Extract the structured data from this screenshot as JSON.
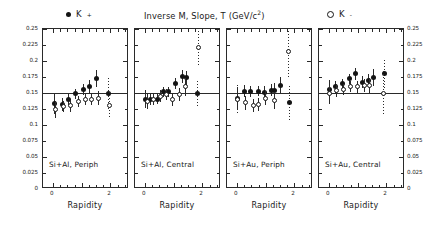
{
  "figure": {
    "title": "Inverse M, Slope, T (GeV/c",
    "title_sup": "2",
    "title_close": ")",
    "legend": [
      {
        "marker": "filled-circle",
        "label": "K",
        "sup": "+",
        "name": "legend-k-plus"
      },
      {
        "marker": "open-circle",
        "label": "K",
        "sup": "-",
        "name": "legend-k-minus"
      }
    ],
    "axis_title_x": "Rapidity"
  },
  "chart_data": {
    "type": "scatter",
    "xlabel": "Rapidity",
    "ylabel": "T (GeV/c^2)",
    "xlim": [
      -0.35,
      2.65
    ],
    "ylim": [
      0,
      0.25
    ],
    "xticks": [
      0,
      2
    ],
    "xticklabels": [
      "0",
      "2"
    ],
    "yticks": [
      0,
      0.025,
      0.05,
      0.075,
      0.1,
      0.125,
      0.15,
      0.175,
      0.2,
      0.225,
      0.25
    ],
    "yticklabels": [
      "0",
      "0.025",
      "0.05",
      "0.075",
      "0.1",
      "0.125",
      "0.15",
      "0.175",
      "0.2",
      "0.225",
      "0.25"
    ],
    "grid": false,
    "reference_line_y": 0.15,
    "legend_position": "top",
    "panels": [
      {
        "label": "Si+Al, Periph",
        "series": [
          {
            "name": "K+",
            "marker": "filled-circle",
            "points": [
              {
                "x": 0.05,
                "y": 0.1335,
                "yerr": 0.016
              },
              {
                "x": 0.32,
                "y": 0.132,
                "yerr": 0.01
              },
              {
                "x": 0.55,
                "y": 0.14,
                "yerr": 0.009
              },
              {
                "x": 0.8,
                "y": 0.149,
                "yerr": 0.008
              },
              {
                "x": 1.08,
                "y": 0.1555,
                "yerr": 0.009
              },
              {
                "x": 1.28,
                "y": 0.16,
                "yerr": 0.01
              },
              {
                "x": 1.52,
                "y": 0.1725,
                "yerr": 0.013
              },
              {
                "x": 1.95,
                "y": 0.149,
                "yerr": 0.024
              }
            ]
          },
          {
            "name": "K-",
            "marker": "open-circle",
            "points": [
              {
                "x": 0.1,
                "y": 0.1245,
                "yerr": 0.013
              },
              {
                "x": 0.36,
                "y": 0.129,
                "yerr": 0.009
              },
              {
                "x": 0.6,
                "y": 0.13,
                "yerr": 0.009
              },
              {
                "x": 0.88,
                "y": 0.137,
                "yerr": 0.009
              },
              {
                "x": 1.12,
                "y": 0.1395,
                "yerr": 0.009
              },
              {
                "x": 1.34,
                "y": 0.14,
                "yerr": 0.009
              },
              {
                "x": 1.58,
                "y": 0.1415,
                "yerr": 0.011
              },
              {
                "x": 1.98,
                "y": 0.131,
                "yerr": 0.021
              }
            ]
          }
        ]
      },
      {
        "label": "Si+Al, Central",
        "series": [
          {
            "name": "K+",
            "marker": "filled-circle",
            "points": [
              {
                "x": 0.02,
                "y": 0.14,
                "yerr": 0.014
              },
              {
                "x": 0.2,
                "y": 0.1395,
                "yerr": 0.009
              },
              {
                "x": 0.44,
                "y": 0.1405,
                "yerr": 0.008
              },
              {
                "x": 0.66,
                "y": 0.152,
                "yerr": 0.008
              },
              {
                "x": 0.82,
                "y": 0.152,
                "yerr": 0.008
              },
              {
                "x": 1.08,
                "y": 0.1645,
                "yerr": 0.009
              },
              {
                "x": 1.32,
                "y": 0.176,
                "yerr": 0.01
              },
              {
                "x": 1.44,
                "y": 0.1735,
                "yerr": 0.011
              },
              {
                "x": 1.82,
                "y": 0.1495,
                "yerr": 0.02
              }
            ]
          },
          {
            "name": "K-",
            "marker": "open-circle",
            "points": [
              {
                "x": 0.08,
                "y": 0.137,
                "yerr": 0.012
              },
              {
                "x": 0.3,
                "y": 0.14,
                "yerr": 0.009
              },
              {
                "x": 0.54,
                "y": 0.145,
                "yerr": 0.009
              },
              {
                "x": 0.74,
                "y": 0.148,
                "yerr": 0.009
              },
              {
                "x": 0.96,
                "y": 0.1395,
                "yerr": 0.01
              },
              {
                "x": 1.2,
                "y": 0.148,
                "yerr": 0.01
              },
              {
                "x": 1.4,
                "y": 0.1595,
                "yerr": 0.014
              },
              {
                "x": 1.88,
                "y": 0.221,
                "yerr": 0.03
              }
            ]
          }
        ]
      },
      {
        "label": "Si+Au, Periph",
        "series": [
          {
            "name": "K+",
            "marker": "filled-circle",
            "points": [
              {
                "x": 0.0,
                "y": 0.142,
                "yerr": 0.017
              },
              {
                "x": 0.26,
                "y": 0.153,
                "yerr": 0.009
              },
              {
                "x": 0.48,
                "y": 0.1525,
                "yerr": 0.009
              },
              {
                "x": 0.74,
                "y": 0.153,
                "yerr": 0.008
              },
              {
                "x": 0.96,
                "y": 0.1515,
                "yerr": 0.009
              },
              {
                "x": 1.2,
                "y": 0.1545,
                "yerr": 0.009
              },
              {
                "x": 1.32,
                "y": 0.1545,
                "yerr": 0.011
              },
              {
                "x": 1.52,
                "y": 0.1625,
                "yerr": 0.013
              },
              {
                "x": 1.82,
                "y": 0.1345,
                "yerr": 0.026
              }
            ]
          },
          {
            "name": "K-",
            "marker": "open-circle",
            "points": [
              {
                "x": 0.02,
                "y": 0.14,
                "yerr": 0.022
              },
              {
                "x": 0.3,
                "y": 0.135,
                "yerr": 0.011
              },
              {
                "x": 0.56,
                "y": 0.131,
                "yerr": 0.01
              },
              {
                "x": 0.76,
                "y": 0.132,
                "yerr": 0.01
              },
              {
                "x": 1.0,
                "y": 0.1415,
                "yerr": 0.011
              },
              {
                "x": 1.3,
                "y": 0.1385,
                "yerr": 0.013
              },
              {
                "x": 1.8,
                "y": 0.2145,
                "yerr": 0.042
              }
            ]
          }
        ]
      },
      {
        "label": "Si+Au, Central",
        "series": [
          {
            "name": "K+",
            "marker": "filled-circle",
            "points": [
              {
                "x": 0.02,
                "y": 0.156,
                "yerr": 0.014
              },
              {
                "x": 0.22,
                "y": 0.1595,
                "yerr": 0.009
              },
              {
                "x": 0.46,
                "y": 0.1645,
                "yerr": 0.008
              },
              {
                "x": 0.7,
                "y": 0.172,
                "yerr": 0.008
              },
              {
                "x": 0.94,
                "y": 0.18,
                "yerr": 0.009
              },
              {
                "x": 1.16,
                "y": 0.167,
                "yerr": 0.009
              },
              {
                "x": 1.36,
                "y": 0.169,
                "yerr": 0.01
              },
              {
                "x": 1.56,
                "y": 0.1745,
                "yerr": 0.013
              },
              {
                "x": 1.92,
                "y": 0.18,
                "yerr": 0.022
              }
            ]
          },
          {
            "name": "K-",
            "marker": "open-circle",
            "points": [
              {
                "x": 0.02,
                "y": 0.149,
                "yerr": 0.016
              },
              {
                "x": 0.26,
                "y": 0.1535,
                "yerr": 0.01
              },
              {
                "x": 0.5,
                "y": 0.1555,
                "yerr": 0.009
              },
              {
                "x": 0.76,
                "y": 0.16,
                "yerr": 0.009
              },
              {
                "x": 1.0,
                "y": 0.1595,
                "yerr": 0.009
              },
              {
                "x": 1.22,
                "y": 0.1615,
                "yerr": 0.01
              },
              {
                "x": 1.42,
                "y": 0.161,
                "yerr": 0.013
              },
              {
                "x": 1.9,
                "y": 0.15,
                "yerr": 0.035
              }
            ]
          }
        ]
      }
    ]
  }
}
